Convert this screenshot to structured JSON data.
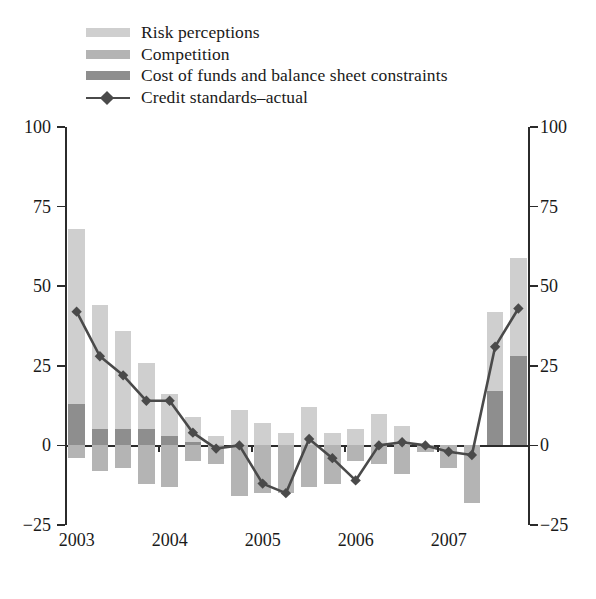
{
  "legend": {
    "items": [
      {
        "label": "Risk perceptions",
        "type": "swatch",
        "color": "#cfcfcf",
        "name": "legend-risk-perceptions"
      },
      {
        "label": "Competition",
        "type": "swatch",
        "color": "#b4b4b4",
        "name": "legend-competition"
      },
      {
        "label": "Cost of funds and balance sheet constraints",
        "type": "swatch",
        "color": "#8e8e8e",
        "name": "legend-cost-of-funds"
      },
      {
        "label": "Credit standards–actual",
        "type": "line",
        "color": "#4a4a4a",
        "name": "legend-credit-standards"
      }
    ]
  },
  "axes": {
    "y_ticks_left": [
      "100",
      "75",
      "50",
      "25",
      "0",
      "−25"
    ],
    "y_ticks_right": [
      "100",
      "75",
      "50",
      "25",
      "0",
      "−25"
    ],
    "x_ticks": [
      "2003",
      "2004",
      "2005",
      "2006",
      "2007"
    ]
  },
  "chart_data": {
    "type": "bar",
    "title": "",
    "subtitle": "",
    "xlabel": "",
    "ylabel": "",
    "ylim": [
      -25,
      100
    ],
    "yticks": [
      -25,
      0,
      25,
      50,
      75,
      100
    ],
    "grid": false,
    "legend_position": "top-left",
    "stacked": true,
    "x": [
      "2003Q1",
      "2003Q2",
      "2003Q3",
      "2003Q4",
      "2004Q1",
      "2004Q2",
      "2004Q3",
      "2004Q4",
      "2005Q1",
      "2005Q2",
      "2005Q3",
      "2005Q4",
      "2006Q1",
      "2006Q2",
      "2006Q3",
      "2006Q4",
      "2007Q1",
      "2007Q2",
      "2007Q3",
      "2007Q4"
    ],
    "x_tick_labels": [
      "2003",
      "2004",
      "2005",
      "2006",
      "2007"
    ],
    "x_tick_index": [
      0,
      4,
      8,
      12,
      16
    ],
    "series": [
      {
        "name": "Risk perceptions",
        "color": "#cfcfcf",
        "values": [
          55,
          39,
          31,
          21,
          13,
          8,
          3,
          11,
          7,
          4,
          12,
          4,
          5,
          10,
          6,
          0,
          0,
          0,
          25,
          31
        ]
      },
      {
        "name": "Competition",
        "color": "#b4b4b4",
        "values": [
          -4,
          -8,
          -7,
          -12,
          -13,
          -5,
          -6,
          -16,
          -15,
          -15,
          -13,
          -12,
          -5,
          -6,
          -9,
          -2,
          -7,
          -18,
          0,
          0
        ]
      },
      {
        "name": "Cost of funds and balance sheet constraints",
        "color": "#8e8e8e",
        "values": [
          13,
          5,
          5,
          5,
          3,
          1,
          0,
          0,
          0,
          0,
          0,
          0,
          0,
          0,
          0,
          0,
          0,
          0,
          17,
          28
        ]
      }
    ],
    "line_series": {
      "name": "Credit standards–actual",
      "color": "#4a4a4a",
      "marker": "diamond",
      "values": [
        42,
        28,
        22,
        14,
        14,
        4,
        -1,
        0,
        -12,
        -15,
        2,
        -4,
        -11,
        0,
        1,
        0,
        -2,
        -3,
        31,
        43
      ]
    }
  }
}
